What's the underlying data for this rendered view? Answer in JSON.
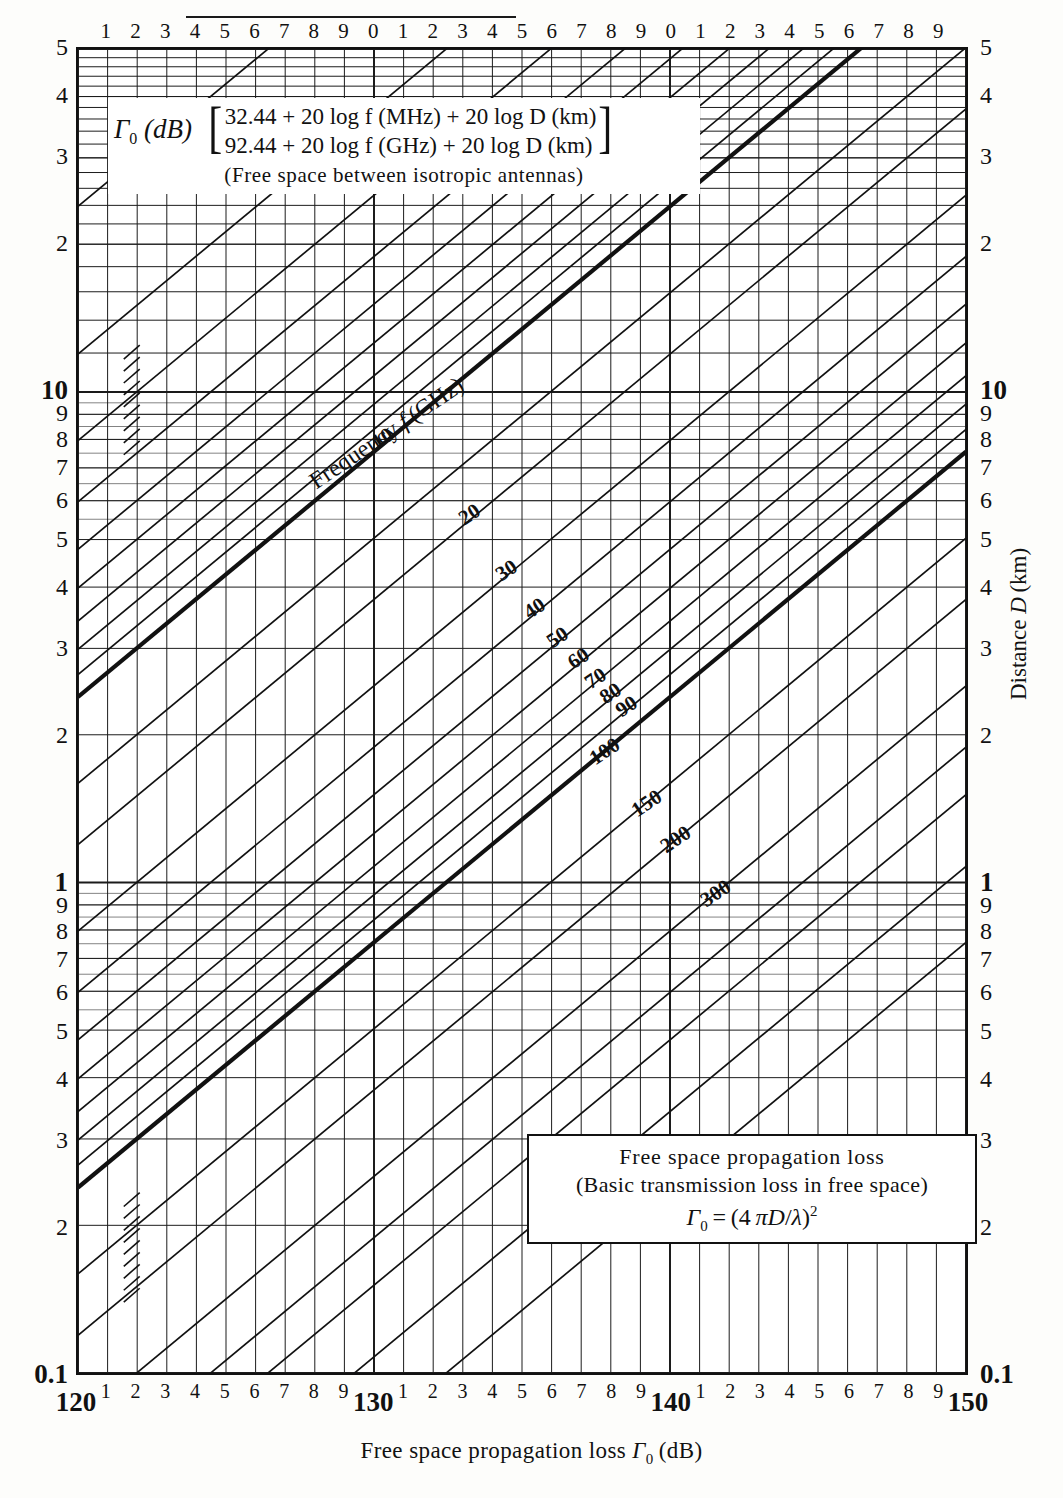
{
  "chart_data": {
    "type": "line",
    "title": "Free space propagation loss",
    "subtitle": "(Basic transmission loss in free space)",
    "formula_main": "Γ₀ = (4 πD/λ)²",
    "header": {
      "symbol": "Γ",
      "symbol_sub": "0",
      "symbol_unit": "(dB)",
      "bracket_line1": "32.44 + 20 log f (MHz) + 20 log D (km)",
      "bracket_line2": "92.44 + 20 log f (GHz) + 20 log D (km)",
      "note": "(Free space between isotropic antennas)"
    },
    "xlabel": "Free space propagation loss Γ₀ (dB)",
    "ylabel": "Distance D (km)",
    "xscale": "log-decades-in-dB",
    "xlim_db": [
      120,
      150
    ],
    "ylim": [
      0.1,
      50
    ],
    "yscale": "log",
    "grid": true,
    "legend_position": "inside-bottom-right",
    "curve_family_label": "Frequency f (GHz)",
    "x_axis": {
      "major_labels": [
        "120",
        "130",
        "140",
        "150"
      ],
      "major_values": [
        120,
        130,
        140,
        150
      ],
      "minor_labels": [
        "1",
        "2",
        "3",
        "4",
        "5",
        "6",
        "7",
        "8",
        "9"
      ],
      "top_labels": [
        "1",
        "2",
        "3",
        "4",
        "5",
        "6",
        "7",
        "8",
        "9",
        "0",
        "1",
        "2",
        "3",
        "4",
        "5",
        "6",
        "7",
        "8",
        "9",
        "0",
        "1",
        "2",
        "3",
        "4",
        "5",
        "6",
        "7",
        "8",
        "9"
      ]
    },
    "y_axis": {
      "top_label": "5",
      "bottom_label": "0.1",
      "decade_labels": [
        "10",
        "1"
      ],
      "tick_labels_upper": [
        "5",
        "4",
        "3",
        "2"
      ],
      "tick_labels_dec10": [
        "10",
        "9",
        "8",
        "7",
        "6",
        "5",
        "4",
        "3",
        "2"
      ],
      "tick_labels_dec1": [
        "1",
        "9",
        "8",
        "7",
        "6",
        "5",
        "4",
        "3",
        "2"
      ],
      "end_label": "0.1"
    },
    "series": [
      {
        "name": "10",
        "freq_ghz": 10
      },
      {
        "name": "20",
        "freq_ghz": 20
      },
      {
        "name": "30",
        "freq_ghz": 30
      },
      {
        "name": "40",
        "freq_ghz": 40
      },
      {
        "name": "50",
        "freq_ghz": 50
      },
      {
        "name": "60",
        "freq_ghz": 60
      },
      {
        "name": "70",
        "freq_ghz": 70
      },
      {
        "name": "80",
        "freq_ghz": 80
      },
      {
        "name": "90",
        "freq_ghz": 90
      },
      {
        "name": "100",
        "freq_ghz": 100
      },
      {
        "name": "150",
        "freq_ghz": 150
      },
      {
        "name": "200",
        "freq_ghz": 200
      },
      {
        "name": "300",
        "freq_ghz": 300
      }
    ],
    "colors": {
      "ink": "#111111",
      "grid": "#2a2a2a",
      "paper": "#ffffff"
    }
  }
}
